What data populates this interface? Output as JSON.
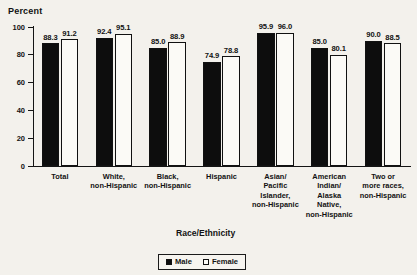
{
  "chart_data": {
    "type": "bar",
    "title": "",
    "ylabel": "Percent",
    "xlabel": "Race/Ethnicity",
    "ylim": [
      0,
      100
    ],
    "yticks": [
      "0",
      "20",
      "40",
      "60",
      "80",
      "100"
    ],
    "grid": false,
    "legend_position": "bottom-center",
    "categories": [
      "Total",
      "White,\nnon-Hispanic",
      "Black,\nnon-Hispanic",
      "Hispanic",
      "Asian/\nPacific\nIslander,\nnon-Hispanic",
      "American\nIndian/\nAlaska\nNative,\nnon-Hispanic",
      "Two or\nmore races,\nnon-Hispanic"
    ],
    "series": [
      {
        "name": "Male",
        "values": [
          88.3,
          92.4,
          85.0,
          74.9,
          95.9,
          85.0,
          90.0
        ]
      },
      {
        "name": "Female",
        "values": [
          91.2,
          95.1,
          88.9,
          78.8,
          96.0,
          80.1,
          88.5
        ]
      }
    ]
  },
  "colors": {
    "male_fill": "#0d0d0d",
    "female_fill": "#fbfaf6",
    "outline": "#111111",
    "background": "#f3f1ec"
  },
  "categories_lines": [
    [
      "Total"
    ],
    [
      "White,",
      "non-Hispanic"
    ],
    [
      "Black,",
      "non-Hispanic"
    ],
    [
      "Hispanic"
    ],
    [
      "Asian/",
      "Pacific",
      "Islander,",
      "non-Hispanic"
    ],
    [
      "American",
      "Indian/",
      "Alaska",
      "Native,",
      "non-Hispanic"
    ],
    [
      "Two or",
      "more races,",
      "non-Hispanic"
    ]
  ],
  "legend": {
    "male_label": "Male",
    "female_label": "Female"
  }
}
